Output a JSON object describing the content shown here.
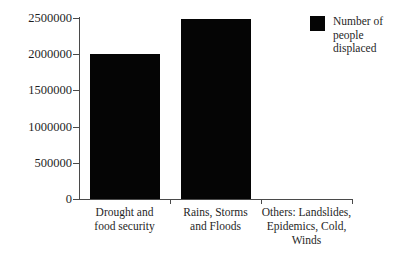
{
  "chart_data": {
    "type": "bar",
    "title": "",
    "subtitle": "",
    "xlabel": "",
    "ylabel": "",
    "categories": [
      "Drought and food security",
      "Rains, Storms and Floods",
      "Others: Landslides, Epidemics, Cold, Winds"
    ],
    "category_lines": [
      [
        "Drought and",
        "food security"
      ],
      [
        "Rains, Storms",
        "and Floods"
      ],
      [
        "Others: Landslides,",
        "Epidemics, Cold,",
        "Winds"
      ]
    ],
    "series": [
      {
        "name": "Number of people displaced",
        "values": [
          2000000,
          2490000,
          0
        ]
      }
    ],
    "values": [
      2000000,
      2490000,
      0
    ],
    "ylim": [
      0,
      2500000
    ],
    "ytick_values": [
      0,
      500000,
      1000000,
      1500000,
      2000000,
      2500000
    ],
    "ytick_labels": [
      "0",
      "500000",
      "1000000",
      "1500000",
      "2000000",
      "2500000"
    ],
    "grid": false,
    "legend": {
      "position": "top-right",
      "entries": [
        {
          "label": "Number of people displaced",
          "label_lines": [
            "Number of people",
            "displaced"
          ],
          "color": "#050505"
        }
      ]
    },
    "colors": {
      "bar": "#050505",
      "axis": "#4a4a4a",
      "text": "#1f1f1f",
      "background": "#ffffff"
    }
  }
}
